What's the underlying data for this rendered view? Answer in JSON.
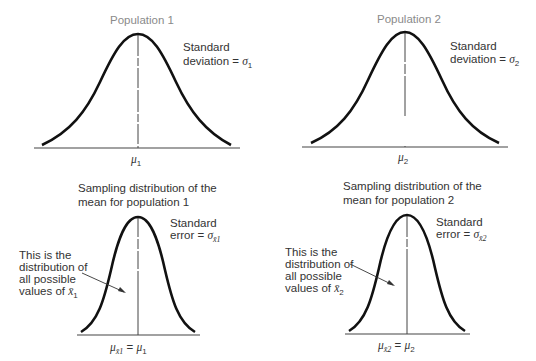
{
  "panels": {
    "pop1": {
      "title": "Population 1",
      "label_line1": "Standard",
      "label_line2": "deviation = ",
      "sigma": "σ",
      "sigma_sub": "1",
      "mean": "μ",
      "mean_sub": "1"
    },
    "pop2": {
      "title": "Population 2",
      "label_line1": "Standard",
      "label_line2": "deviation = ",
      "sigma": "σ",
      "sigma_sub": "2",
      "mean": "μ",
      "mean_sub": "2"
    },
    "samp1": {
      "title_line1": "Sampling distribution of the",
      "title_line2": "mean for population 1",
      "label_line1": "Standard",
      "label_line2": "error = ",
      "sigma": "σ",
      "sigma_sub": "x̄1",
      "note_line1": "This is the",
      "note_line2": "distribution of",
      "note_line3": "all possible",
      "note_line4": "values of ",
      "xbar": "x̄",
      "xbar_sub": "1",
      "mean_left": "μ",
      "mean_left_sub": "x̄1",
      "equals": " = ",
      "mean_right": "μ",
      "mean_right_sub": "1"
    },
    "samp2": {
      "title_line1": "Sampling distribution of the",
      "title_line2": "mean for population 2",
      "label_line1": "Standard",
      "label_line2": "error = ",
      "sigma": "σ",
      "sigma_sub": "x̄2",
      "note_line1": "This is the",
      "note_line2": "distribution of",
      "note_line3": "all possible",
      "note_line4": "values of ",
      "xbar": "x̄",
      "xbar_sub": "2",
      "mean_left": "μ",
      "mean_left_sub": "x̄2",
      "equals": " = ",
      "mean_right": "μ",
      "mean_right_sub": "2"
    }
  },
  "colors": {
    "curve": "#111111",
    "axis": "#333333",
    "text": "#333333",
    "title": "#8a8a8a"
  }
}
